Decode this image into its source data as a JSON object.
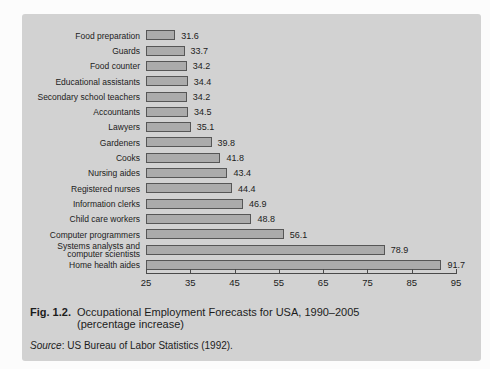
{
  "figure": {
    "fig_label": "Fig. 1.2.",
    "title": "Occupational Employment Forecasts for USA, 1990–2005",
    "subtitle": "(percentage increase)",
    "source_label": "Source",
    "source_rest": ": US Bureau of Labor Statistics (1992)."
  },
  "colors": {
    "page_bg": "#fcfcfc",
    "panel_bg": "#d2d2d2",
    "bar_fill": "#ababab",
    "bar_border": "#565656",
    "axis": "#4a4a4a",
    "text": "#1c1c1c"
  },
  "chart_data": {
    "type": "bar",
    "orientation": "horizontal",
    "title": "Occupational Employment Forecasts for USA, 1990–2005 (percentage increase)",
    "xlabel": "",
    "ylabel": "",
    "grid": false,
    "legend": null,
    "xlim": [
      25,
      95
    ],
    "xticks": [
      25,
      35,
      45,
      55,
      65,
      75,
      85,
      95
    ],
    "categories": [
      "Food preparation",
      "Guards",
      "Food counter",
      "Educational assistants",
      "Secondary school teachers",
      "Accountants",
      "Lawyers",
      "Gardeners",
      "Cooks",
      "Nursing aides",
      "Registered nurses",
      "Information clerks",
      "Child care workers",
      "Computer programmers",
      "Systems analysts and computer scientists",
      "Home health aides"
    ],
    "values": [
      31.6,
      33.7,
      34.2,
      34.4,
      34.2,
      34.5,
      35.1,
      39.8,
      41.8,
      43.4,
      44.4,
      46.9,
      48.8,
      56.1,
      78.9,
      91.7
    ],
    "value_labels": [
      "31.6",
      "33.7",
      "34.2",
      "34.4",
      "34.2",
      "34.5",
      "35.1",
      "39.8",
      "41.8",
      "43.4",
      "44.4",
      "46.9",
      "48.8",
      "56.1",
      "78.9",
      "91.7"
    ]
  }
}
